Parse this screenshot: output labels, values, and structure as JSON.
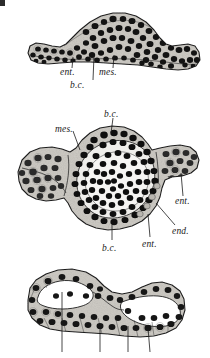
{
  "plate": {
    "kind": "histological-section-plate",
    "background_color": "#ffffff",
    "ink_color": "#1a1a1a",
    "cytoplasm_color": "#cfcdc8",
    "nucleus_color": "#141414",
    "cavity_color": "#fdfdfd",
    "corner_mark": true,
    "figures": [
      {
        "id": "figure-top",
        "name": "top-section",
        "description": "elongated arched blastoderm section with dense dark nuclei",
        "labels": [
          {
            "key": "ent",
            "text": "ent.",
            "x": 61,
            "y": 71,
            "leader": {
              "x1": 70,
              "y1": 69,
              "x2": 72,
              "y2": 58
            }
          },
          {
            "key": "bc",
            "text": "b.c.",
            "x": 71,
            "y": 85,
            "leader": {
              "x1": 90,
              "y1": 81,
              "x2": 93,
              "y2": 56
            }
          },
          {
            "key": "mes",
            "text": "mes.",
            "x": 100,
            "y": 71,
            "leader": {
              "x1": 112,
              "y1": 69,
              "x2": 113,
              "y2": 55
            }
          }
        ]
      },
      {
        "id": "figure-middle",
        "name": "middle-section",
        "description": "large rounded blastoderm section with central mass of nuclei and lateral wings",
        "labels": [
          {
            "key": "bc-top",
            "text": "b.c.",
            "x": 104,
            "y": 114,
            "leader": {
              "x1": 113,
              "y1": 116,
              "x2": 110,
              "y2": 133
            }
          },
          {
            "key": "mes",
            "text": "mes.",
            "x": 55,
            "y": 129,
            "leader": {
              "x1": 72,
              "y1": 132,
              "x2": 79,
              "y2": 150
            }
          },
          {
            "key": "ent",
            "text": "ent.",
            "x": 175,
            "y": 200,
            "leader": {
              "x1": 183,
              "y1": 197,
              "x2": 180,
              "y2": 172
            }
          },
          {
            "key": "end",
            "text": "end.",
            "x": 172,
            "y": 230,
            "leader": {
              "x1": 175,
              "y1": 226,
              "x2": 155,
              "y2": 203
            }
          },
          {
            "key": "ent-bot",
            "text": "ent.",
            "x": 142,
            "y": 243,
            "leader": {
              "x1": 150,
              "y1": 238,
              "x2": 148,
              "y2": 213
            }
          },
          {
            "key": "bc-bot",
            "text": "b.c.",
            "x": 103,
            "y": 247,
            "leader": {
              "x1": 112,
              "y1": 241,
              "x2": 112,
              "y2": 224
            }
          }
        ]
      },
      {
        "id": "figure-bottom",
        "name": "bottom-section",
        "description": "flattened epithelial sheet enclosing two large cavities, leader lines descending below",
        "labels": []
      }
    ]
  }
}
